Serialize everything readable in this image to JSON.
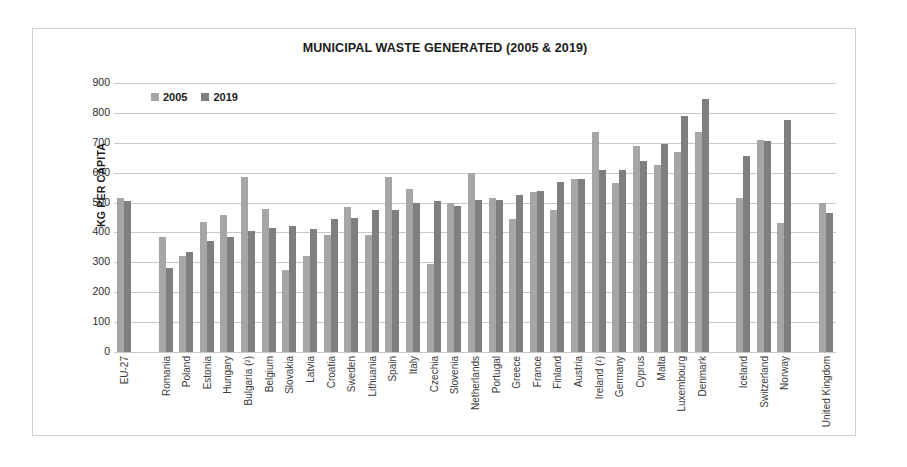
{
  "chart_data": {
    "type": "bar",
    "title": "MUNICIPAL WASTE GENERATED (2005 & 2019)",
    "xlabel": "",
    "ylabel": "KG PER CAPITA",
    "ylim": [
      0,
      900
    ],
    "ytick_step": 100,
    "yticks": [
      900,
      800,
      700,
      600,
      500,
      400,
      300,
      200,
      100,
      0
    ],
    "grid": true,
    "legend_position": "top-left",
    "legend": [
      "2005",
      "2019"
    ],
    "colors": {
      "2005": "#a6a6a6",
      "2019": "#7f7f7f",
      "grid": "#c9c9c9",
      "frame": "#d3d3d3"
    },
    "categories": [
      "EU-27",
      "",
      "Romania",
      "Poland",
      "Estonia",
      "Hungary",
      "Bulgaria (²)",
      "Belgium",
      "Slovakia",
      "Latvia",
      "Croatia",
      "Sweden",
      "Lithuania",
      "Spain",
      "Italy",
      "Czechia",
      "Slovenia",
      "Netherlands",
      "Portugal",
      "Greece",
      "France",
      "Finland",
      "Austria",
      "Ireland (²)",
      "Germany",
      "Cyprus",
      "Malta",
      "Luxembourg",
      "Denmark",
      "",
      "Iceland",
      "Switzerland",
      "Norway",
      "",
      "United Kingdom"
    ],
    "series": [
      {
        "name": "2005",
        "values": [
          515,
          null,
          385,
          320,
          435,
          460,
          585,
          480,
          275,
          320,
          390,
          485,
          390,
          585,
          545,
          295,
          500,
          600,
          515,
          445,
          535,
          475,
          580,
          735,
          565,
          690,
          625,
          670,
          735,
          null,
          515,
          710,
          430,
          null,
          500
        ]
      },
      {
        "name": "2019",
        "values": [
          505,
          null,
          280,
          335,
          370,
          385,
          405,
          415,
          420,
          410,
          445,
          450,
          475,
          475,
          500,
          505,
          490,
          510,
          510,
          525,
          540,
          570,
          580,
          610,
          610,
          640,
          695,
          790,
          845,
          null,
          655,
          705,
          775,
          null,
          465
        ]
      }
    ]
  }
}
